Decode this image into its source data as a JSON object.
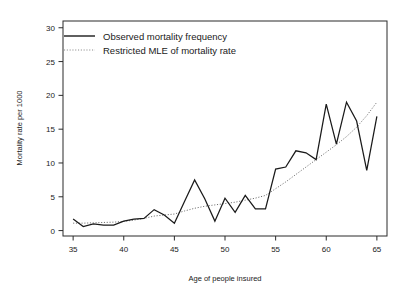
{
  "chart_data": {
    "type": "line",
    "title": "",
    "xlabel": "Age of people insured",
    "ylabel": "Mortality rate per 1000",
    "xlim": [
      34,
      66
    ],
    "ylim": [
      -0.8,
      31
    ],
    "xticks": [
      35,
      40,
      45,
      50,
      55,
      60,
      65
    ],
    "yticks": [
      0,
      5,
      10,
      15,
      20,
      25,
      30
    ],
    "grid": false,
    "legend_position": "top-left",
    "x": [
      35,
      36,
      37,
      38,
      39,
      40,
      41,
      42,
      43,
      44,
      45,
      46,
      47,
      48,
      49,
      50,
      51,
      52,
      53,
      54,
      55,
      56,
      57,
      58,
      59,
      60,
      61,
      62,
      63,
      64,
      65
    ],
    "series": [
      {
        "name": "Observed mortality frequency",
        "style": "solid",
        "color": "#1a1a1a",
        "values": [
          1.7,
          0.6,
          1.0,
          0.8,
          0.8,
          1.4,
          1.7,
          1.8,
          3.1,
          2.3,
          1.1,
          4.3,
          7.5,
          4.7,
          1.4,
          4.8,
          2.7,
          5.2,
          3.2,
          3.2,
          9.1,
          9.4,
          11.8,
          11.5,
          10.5,
          18.7,
          12.8,
          19.0,
          16.2,
          8.9,
          16.9
        ]
      },
      {
        "name": "Restricted MLE of mortality rate",
        "style": "dotted",
        "color": "#6e6e6e",
        "values": [
          1.1,
          1.1,
          1.15,
          1.2,
          1.25,
          1.35,
          1.55,
          1.8,
          2.15,
          2.3,
          2.45,
          2.9,
          3.3,
          3.6,
          3.8,
          4.0,
          4.2,
          4.5,
          4.8,
          5.2,
          6.2,
          7.2,
          8.3,
          9.4,
          10.5,
          11.6,
          12.7,
          13.9,
          15.3,
          17.0,
          19.0
        ]
      }
    ]
  },
  "legend": {
    "entries": [
      {
        "label": "Observed mortality frequency",
        "style": "solid"
      },
      {
        "label": "Restricted MLE of mortality rate",
        "style": "dotted"
      }
    ]
  }
}
